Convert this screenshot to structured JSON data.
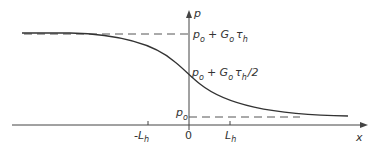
{
  "diagram": {
    "type": "sigmoid-profile",
    "axes": {
      "x_label": "x",
      "y_label": "p",
      "origin_label": "0"
    },
    "ticks": [
      {
        "label_main": "-L",
        "label_sub": "h",
        "position": "negative"
      },
      {
        "label_main": "L",
        "label_sub": "h",
        "position": "positive"
      }
    ],
    "levels": {
      "upper": {
        "p": "p",
        "p_sub": "o",
        "plus": "+ G",
        "g_sub": "o",
        "tau": "τ",
        "tau_sub": "h",
        "suffix": ""
      },
      "middle": {
        "p": "p",
        "p_sub": "o",
        "plus": "+ G",
        "g_sub": "o",
        "tau": "τ",
        "tau_sub": "h",
        "suffix": "/2"
      },
      "lower": {
        "p": "p",
        "p_sub": "o"
      }
    },
    "colors": {
      "line": "#333333",
      "dash": "#555555"
    }
  }
}
